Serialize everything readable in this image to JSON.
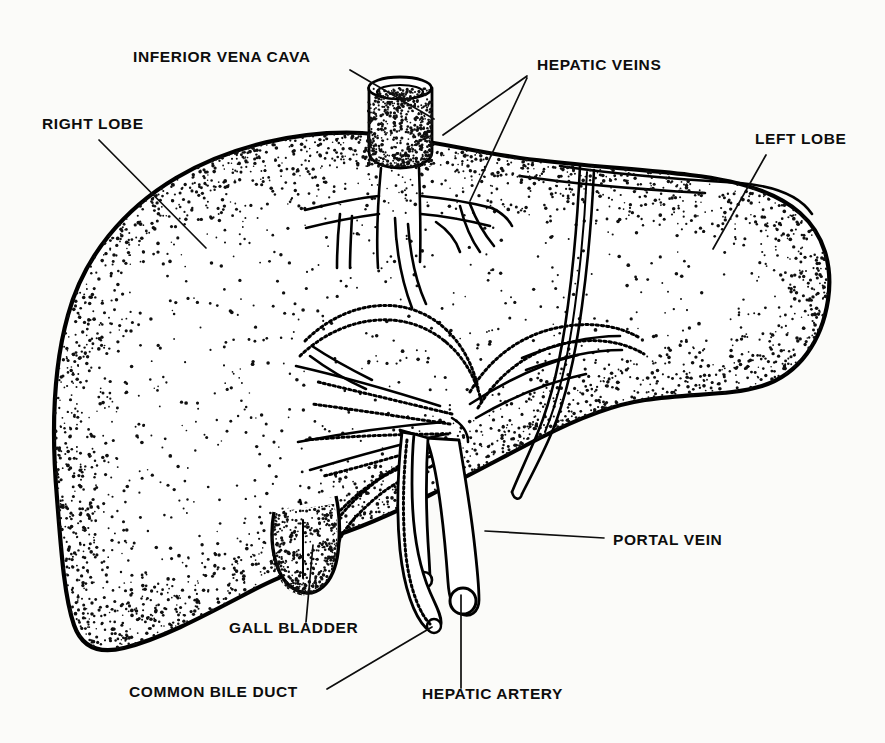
{
  "diagram": {
    "style": "black-and-white stippled anatomical line drawing",
    "background_color": "#fbfbf9",
    "ink_color": "#000000",
    "labels": [
      {
        "id": "inferior-vena-cava",
        "text": "INFERIOR VENA CAVA",
        "text_x": 133,
        "text_y": 62,
        "anchor": "start",
        "leader": "M 350 70 L 434 119"
      },
      {
        "id": "hepatic-veins",
        "text": "HEPATIC VEINS",
        "text_x": 537,
        "text_y": 70,
        "anchor": "start",
        "leader": "M 527 76 L 443 135 M 527 78 L 470 201"
      },
      {
        "id": "right-lobe",
        "text": "RIGHT LOBE",
        "text_x": 42,
        "text_y": 129,
        "anchor": "start",
        "leader": "M 99 140 L 206 248"
      },
      {
        "id": "left-lobe",
        "text": "LEFT LOBE",
        "text_x": 755,
        "text_y": 144,
        "anchor": "start",
        "leader": "M 766 155 L 713 249"
      },
      {
        "id": "portal-vein",
        "text": "PORTAL VEIN",
        "text_x": 613,
        "text_y": 545,
        "anchor": "start",
        "leader": "M 604 538 L 485 531"
      },
      {
        "id": "gall-bladder",
        "text": "GALL BLADDER",
        "text_x": 229,
        "text_y": 633,
        "anchor": "start",
        "leader": "M 306 622 L 313 545"
      },
      {
        "id": "common-bile-duct",
        "text": "COMMON BILE DUCT",
        "text_x": 129,
        "text_y": 697,
        "anchor": "start",
        "leader": "M 327 689 L 432 627"
      },
      {
        "id": "hepatic-artery",
        "text": "HEPATIC ARTERY",
        "text_x": 422,
        "text_y": 699,
        "anchor": "start",
        "leader": "M 461 688 L 461 595"
      }
    ],
    "structures": [
      {
        "id": "liver-body",
        "name": "Liver (right and left lobes)"
      },
      {
        "id": "inferior-vena-cava-tube",
        "name": "Inferior vena cava stump"
      },
      {
        "id": "hepatic-vein-branches",
        "name": "Hepatic vein branches"
      },
      {
        "id": "portal-vein-branches",
        "name": "Portal vein branches"
      },
      {
        "id": "gall-bladder-sac",
        "name": "Gall bladder"
      },
      {
        "id": "common-bile-duct-tube",
        "name": "Common bile duct"
      },
      {
        "id": "hepatic-artery-tube",
        "name": "Hepatic artery"
      },
      {
        "id": "portal-vein-trunk",
        "name": "Portal vein trunk"
      },
      {
        "id": "falciform-ligament",
        "name": "Falciform ligament groove"
      }
    ]
  }
}
